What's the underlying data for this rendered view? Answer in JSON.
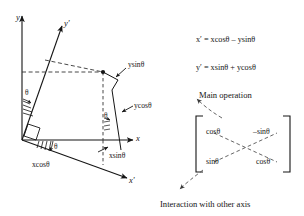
{
  "figure": {
    "title_none": "",
    "background": "#ffffff",
    "stroke": "#151515"
  },
  "left_diagram": {
    "axes": [
      {
        "id": "y-axis",
        "label": "y"
      },
      {
        "id": "y-prime-axis",
        "label": "y'"
      },
      {
        "id": "x-axis",
        "label": "x"
      },
      {
        "id": "x-prime-axis",
        "label": "x'"
      }
    ],
    "component_labels": [
      {
        "id": "ysin",
        "text": "ysinθ"
      },
      {
        "id": "ycos",
        "text": "ycosθ"
      },
      {
        "id": "xsin",
        "text": "xsinθ"
      },
      {
        "id": "xcos",
        "text": "xcosθ"
      }
    ],
    "angle_labels": [
      {
        "id": "theta-upper-left",
        "text": "θ"
      },
      {
        "id": "theta-lower-left",
        "text": "θ"
      },
      {
        "id": "theta-mid-left",
        "text": "θ"
      },
      {
        "id": "theta-right",
        "text": "θ"
      }
    ]
  },
  "equations": {
    "x_prime": "x′ = xcosθ – ysinθ",
    "y_prime": "y′ = xsinθ + ycosθ"
  },
  "matrix": {
    "cells": [
      {
        "id": "m00",
        "text": "cosθ"
      },
      {
        "id": "m01",
        "text": "–sinθ"
      },
      {
        "id": "m10",
        "text": "sinθ"
      },
      {
        "id": "m11",
        "text": "cosθ"
      }
    ]
  },
  "annotations": {
    "main_operation": "Main operation",
    "interaction": "Interaction with other axis"
  }
}
